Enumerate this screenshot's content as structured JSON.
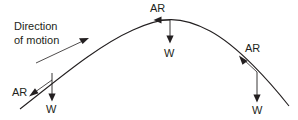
{
  "diagram": {
    "stroke_color": "#231f20",
    "background_color": "#ffffff",
    "caption": {
      "line1": "Direction",
      "line2": "of motion",
      "arrow_name": "direction-of-motion-arrow"
    },
    "trajectory": {
      "name": "projectile-path",
      "shape": "parabolic-arc",
      "start_point": [
        20,
        109
      ],
      "apex_point": [
        170,
        20
      ],
      "end_point": [
        289,
        106
      ]
    },
    "force_points": [
      {
        "id": "ascending",
        "position": [
          52,
          73
        ],
        "air_resistance": {
          "label": "AR",
          "label_x": 12,
          "label_y": 86,
          "direction": "down-left-tangent"
        },
        "weight": {
          "label": "W",
          "label_x": 46,
          "label_y": 103,
          "direction": "down"
        }
      },
      {
        "id": "apex",
        "position": [
          170,
          20
        ],
        "air_resistance": {
          "label": "AR",
          "label_x": 150,
          "label_y": 2,
          "direction": "left-horizontal"
        },
        "weight": {
          "label": "W",
          "label_x": 164,
          "label_y": 47,
          "direction": "down"
        }
      },
      {
        "id": "descending",
        "position": [
          257,
          72
        ],
        "air_resistance": {
          "label": "AR",
          "label_x": 245,
          "label_y": 42,
          "direction": "up-left-tangent"
        },
        "weight": {
          "label": "W",
          "label_x": 252,
          "label_y": 104,
          "direction": "down"
        }
      }
    ]
  }
}
